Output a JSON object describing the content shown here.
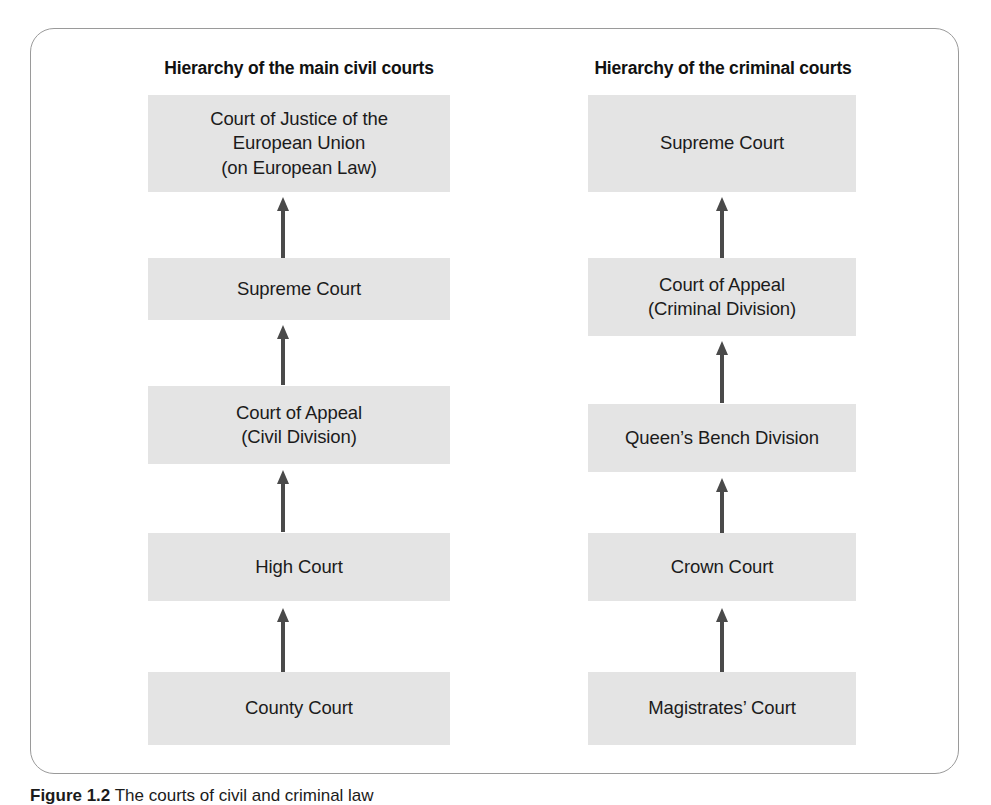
{
  "figure": {
    "caption_label": "Figure 1.2",
    "caption_text": "The courts of civil and criminal law",
    "panel_border_color": "#9a9a9a",
    "box_fill_color": "#e4e4e4",
    "arrow_color": "#4a4a4a",
    "text_color": "#1b1b1b"
  },
  "columns": [
    {
      "id": "civil",
      "heading": "Hierarchy of the main civil courts",
      "boxes": [
        {
          "line1": "Court of Justice of the",
          "line2": "European Union",
          "line3": "(on European Law)"
        },
        {
          "line1": "Supreme Court"
        },
        {
          "line1": "Court of Appeal",
          "line2": "(Civil Division)"
        },
        {
          "line1": "High Court"
        },
        {
          "line1": "County Court"
        }
      ],
      "arrows": [
        {
          "from": "Supreme Court",
          "to": "Court of Justice of the European Union (on European Law)"
        },
        {
          "from": "Court of Appeal (Civil Division)",
          "to": "Supreme Court"
        },
        {
          "from": "High Court",
          "to": "Court of Appeal (Civil Division)"
        },
        {
          "from": "County Court",
          "to": "High Court"
        }
      ]
    },
    {
      "id": "criminal",
      "heading": "Hierarchy of the criminal courts",
      "boxes": [
        {
          "line1": "Supreme Court"
        },
        {
          "line1": "Court of Appeal",
          "line2": "(Criminal Division)"
        },
        {
          "line1": "Queen’s Bench Division"
        },
        {
          "line1": "Crown Court"
        },
        {
          "line1": "Magistrates’ Court"
        }
      ],
      "arrows": [
        {
          "from": "Court of Appeal (Criminal Division)",
          "to": "Supreme Court"
        },
        {
          "from": "Queen’s Bench Division",
          "to": "Court of Appeal (Criminal Division)"
        },
        {
          "from": "Crown Court",
          "to": "Queen’s Bench Division"
        },
        {
          "from": "Magistrates’ Court",
          "to": "Crown Court"
        }
      ]
    }
  ]
}
